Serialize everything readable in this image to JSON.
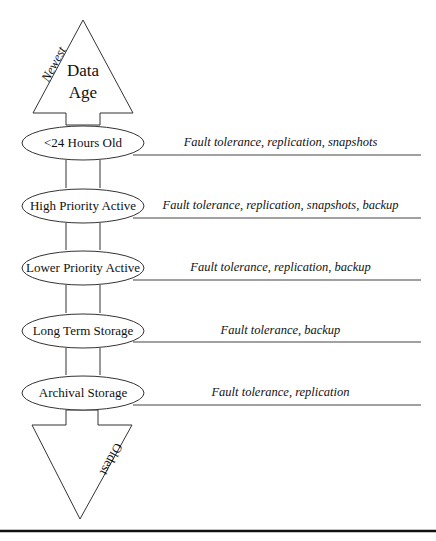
{
  "diagram": {
    "title_lines": [
      "Data",
      "Age"
    ],
    "top_label": "Newest",
    "bottom_label": "Oldest",
    "tiers": [
      {
        "name": "<24 Hours Old",
        "protections": "Fault tolerance, replication, snapshots"
      },
      {
        "name": "High Priority Active",
        "protections": "Fault tolerance, replication, snapshots, backup"
      },
      {
        "name": "Lower Priority Active",
        "protections": "Fault tolerance, replication, backup"
      },
      {
        "name": "Long Term Storage",
        "protections": "Fault tolerance, backup"
      },
      {
        "name": "Archival Storage",
        "protections": "Fault tolerance, replication"
      }
    ]
  }
}
